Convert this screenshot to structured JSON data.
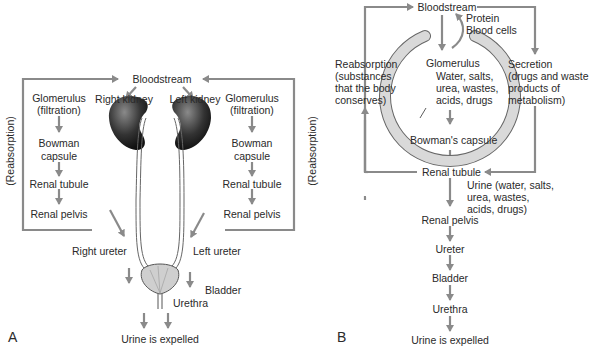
{
  "panel_a": {
    "label": "A",
    "bloodstream": "Bloodstream",
    "right_kidney": "Right kidney",
    "left_kidney": "Left kidney",
    "left_column": [
      "Glomerulus",
      "(filtration)",
      "Bowman",
      "capsule",
      "Renal tubule",
      "Renal pelvis"
    ],
    "right_column": [
      "Glomerulus",
      "(filtration)",
      "Bowman",
      "capsule",
      "Renal tubule",
      "Renal pelvis"
    ],
    "reabsorption_left": "(Reabsorption)",
    "reabsorption_right": "(Reabsorption)",
    "right_ureter": "Right ureter",
    "left_ureter": "Left ureter",
    "bladder": "Bladder",
    "urethra": "Urethra",
    "expelled": "Urine is expelled"
  },
  "panel_b": {
    "label": "B",
    "bloodstream": "Bloodstream",
    "protein": "Protein",
    "blood_cells": "Blood cells",
    "reabsorption": [
      "Reabsorption",
      "(substances",
      "that the body",
      "conserves)"
    ],
    "secretion": [
      "Secretion",
      "(drugs and waste",
      "products of",
      "metabolism)"
    ],
    "glomerulus": "Glomerulus",
    "filtrate": [
      "Water, salts,",
      "urea, wastes,",
      "acids, drugs"
    ],
    "bowmans_capsule": "Bowman's capsule",
    "renal_tubule": "Renal tubule",
    "urine": [
      "Urine (water, salts,",
      "urea, wastes,",
      "acids, drugs)"
    ],
    "renal_pelvis": "Renal pelvis",
    "ureter": "Ureter",
    "bladder": "Bladder",
    "urethra": "Urethra",
    "expelled": "Urine is expelled"
  },
  "colors": {
    "arrow": "#8a8a8a",
    "kidney": "#3a3a3a",
    "capsule": "#d9d9d9"
  }
}
